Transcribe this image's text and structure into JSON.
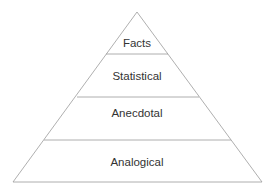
{
  "diagram": {
    "type": "pyramid",
    "levels": [
      {
        "label": "Facts"
      },
      {
        "label": "Statistical"
      },
      {
        "label": "Anecdotal"
      },
      {
        "label": "Analogical"
      }
    ],
    "line_color": "#9a9a9a",
    "text_color": "#333333"
  }
}
